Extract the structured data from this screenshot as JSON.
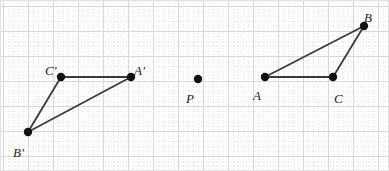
{
  "figure": {
    "name": "triangle-reflection-diagram",
    "width": 389,
    "height": 171,
    "background_color": "#ffffff",
    "border_color": "#e2e2e2"
  },
  "grid": {
    "minor_spacing": 5,
    "minor_color": "#e8e8ea",
    "major_spacing": 25,
    "major_color": "#d8d8dc",
    "major_origin_x": 3,
    "major_origin_y": 6
  },
  "style": {
    "segment_color": "#3a3a3a",
    "segment_width": 1.8,
    "point_color": "#111111",
    "point_radius": 4.2,
    "label_color": "#1a1a1a",
    "label_font_size": 13
  },
  "points": [
    {
      "id": "B",
      "label": "B",
      "x": 364,
      "y": 26,
      "label_x": 364,
      "label_y": 11,
      "label_anchor": "above-right"
    },
    {
      "id": "A",
      "label": "A",
      "x": 265,
      "y": 77,
      "label_x": 253,
      "label_y": 89,
      "label_anchor": "below-left"
    },
    {
      "id": "C",
      "label": "C",
      "x": 333,
      "y": 77,
      "label_x": 334,
      "label_y": 92,
      "label_anchor": "below-right"
    },
    {
      "id": "P",
      "label": "P",
      "x": 198,
      "y": 79,
      "label_x": 186,
      "label_y": 92,
      "label_anchor": "below-left"
    },
    {
      "id": "A-prime",
      "label": "A'",
      "x": 131,
      "y": 77,
      "label_x": 134,
      "label_y": 64,
      "label_anchor": "above-right"
    },
    {
      "id": "C-prime",
      "label": "C'",
      "x": 61,
      "y": 77,
      "label_x": 45,
      "label_y": 64,
      "label_anchor": "above-left"
    },
    {
      "id": "B-prime",
      "label": "B'",
      "x": 28,
      "y": 132,
      "label_x": 13,
      "label_y": 146,
      "label_anchor": "below-left"
    }
  ],
  "segments": [
    {
      "id": "segment-AB",
      "from": "A",
      "to": "B"
    },
    {
      "id": "segment-BC",
      "from": "B",
      "to": "C"
    },
    {
      "id": "segment-AC",
      "from": "A",
      "to": "C"
    },
    {
      "id": "segment-A-prime-B-prime",
      "from": "A-prime",
      "to": "B-prime"
    },
    {
      "id": "segment-B-prime-C-prime",
      "from": "B-prime",
      "to": "C-prime"
    },
    {
      "id": "segment-C-prime-A-prime",
      "from": "C-prime",
      "to": "A-prime"
    }
  ],
  "chart_data": {
    "type": "scatter",
    "title": "",
    "xlabel": "",
    "ylabel": "",
    "labels": [
      "B",
      "A",
      "C",
      "P",
      "A'",
      "C'",
      "B'"
    ],
    "x": [
      364,
      265,
      333,
      198,
      131,
      61,
      28
    ],
    "y": [
      26,
      77,
      77,
      79,
      77,
      77,
      132
    ],
    "grid": true,
    "legend": "none"
  }
}
